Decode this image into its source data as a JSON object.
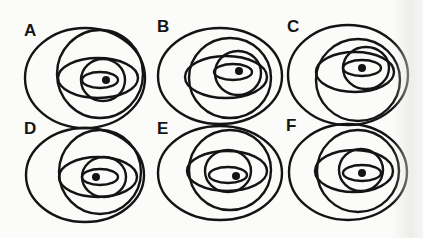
{
  "figure": {
    "stroke_color": "#141414",
    "background_color": "#fbfbf9",
    "panels": [
      {
        "label": "A",
        "label_pos": [
          24,
          36
        ],
        "outer": {
          "cx": 85,
          "cy": 78,
          "rx": 60,
          "ry": 50
        },
        "circle": {
          "cx": 100,
          "cy": 74,
          "rx": 43,
          "ry": 44
        },
        "wide": {
          "cx": 98,
          "cy": 78,
          "rx": 40,
          "ry": 20
        },
        "mid_circle": {
          "cx": 103,
          "cy": 80,
          "rx": 22,
          "ry": 21
        },
        "small": {
          "cx": 100,
          "cy": 80,
          "rx": 18,
          "ry": 8
        },
        "dot": {
          "cx": 106,
          "cy": 80,
          "r": 4
        }
      },
      {
        "label": "B",
        "label_pos": [
          157,
          32
        ],
        "outer": {
          "cx": 220,
          "cy": 76,
          "rx": 62,
          "ry": 48
        },
        "circle": {
          "cx": 230,
          "cy": 78,
          "rx": 41,
          "ry": 40
        },
        "wide": {
          "cx": 226,
          "cy": 77,
          "rx": 41,
          "ry": 21
        },
        "mid_circle": {
          "cx": 238,
          "cy": 73,
          "rx": 23,
          "ry": 22
        },
        "small": {
          "cx": 233,
          "cy": 72,
          "rx": 19,
          "ry": 8
        },
        "dot": {
          "cx": 239,
          "cy": 71,
          "r": 4
        }
      },
      {
        "label": "C",
        "label_pos": [
          287,
          32
        ],
        "outer": {
          "cx": 348,
          "cy": 75,
          "rx": 60,
          "ry": 50
        },
        "circle": {
          "cx": 358,
          "cy": 80,
          "rx": 42,
          "ry": 41
        },
        "wide": {
          "cx": 355,
          "cy": 72,
          "rx": 39,
          "ry": 20
        },
        "mid_circle": {
          "cx": 366,
          "cy": 68,
          "rx": 23,
          "ry": 21
        },
        "small": {
          "cx": 362,
          "cy": 68,
          "rx": 19,
          "ry": 8
        },
        "dot": {
          "cx": 362,
          "cy": 68,
          "r": 4
        }
      },
      {
        "label": "D",
        "label_pos": [
          24,
          134
        ],
        "outer": {
          "cx": 85,
          "cy": 175,
          "rx": 59,
          "ry": 47
        },
        "circle": {
          "cx": 100,
          "cy": 172,
          "rx": 41,
          "ry": 42
        },
        "wide": {
          "cx": 98,
          "cy": 177,
          "rx": 39,
          "ry": 20
        },
        "mid_circle": {
          "cx": 104,
          "cy": 177,
          "rx": 22,
          "ry": 20
        },
        "small": {
          "cx": 100,
          "cy": 177,
          "rx": 18,
          "ry": 8
        },
        "dot": {
          "cx": 96,
          "cy": 177,
          "r": 4
        }
      },
      {
        "label": "E",
        "label_pos": [
          157,
          134
        ],
        "outer": {
          "cx": 220,
          "cy": 173,
          "rx": 62,
          "ry": 47
        },
        "circle": {
          "cx": 230,
          "cy": 170,
          "rx": 41,
          "ry": 40
        },
        "wide": {
          "cx": 227,
          "cy": 171,
          "rx": 40,
          "ry": 20
        },
        "mid_circle": {
          "cx": 228,
          "cy": 171,
          "rx": 23,
          "ry": 21
        },
        "small": {
          "cx": 228,
          "cy": 175,
          "rx": 19,
          "ry": 8
        },
        "dot": {
          "cx": 236,
          "cy": 176,
          "r": 4
        }
      },
      {
        "label": "F",
        "label_pos": [
          286,
          131
        ],
        "outer": {
          "cx": 348,
          "cy": 172,
          "rx": 59,
          "ry": 48
        },
        "circle": {
          "cx": 358,
          "cy": 171,
          "rx": 41,
          "ry": 41
        },
        "wide": {
          "cx": 354,
          "cy": 171,
          "rx": 39,
          "ry": 21
        },
        "mid_circle": {
          "cx": 361,
          "cy": 170,
          "rx": 22,
          "ry": 21
        },
        "small": {
          "cx": 362,
          "cy": 173,
          "rx": 19,
          "ry": 8
        },
        "dot": {
          "cx": 362,
          "cy": 173,
          "r": 4
        }
      }
    ]
  }
}
